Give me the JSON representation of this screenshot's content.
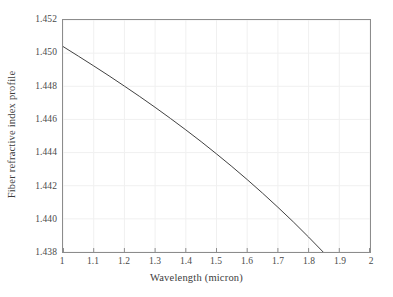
{
  "chart_data": {
    "type": "line",
    "title": "",
    "xlabel": "Wavelength (micron)",
    "ylabel": "Fiber refractive index profile",
    "xlim": [
      1,
      2
    ],
    "ylim": [
      1.438,
      1.452
    ],
    "grid": true,
    "legend": null,
    "xticks": [
      "1",
      "1.1",
      "1.2",
      "1.3",
      "1.4",
      "1.5",
      "1.6",
      "1.7",
      "1.8",
      "1.9",
      "2"
    ],
    "xtick_values": [
      1,
      1.1,
      1.2,
      1.3,
      1.4,
      1.5,
      1.6,
      1.7,
      1.8,
      1.9,
      2
    ],
    "yticks": [
      "1.452",
      "1.450",
      "1.448",
      "1.446",
      "1.444",
      "1.442",
      "1.440",
      "1.438"
    ],
    "ytick_values": [
      1.452,
      1.45,
      1.448,
      1.446,
      1.444,
      1.442,
      1.44,
      1.438
    ],
    "line_color": "#404040",
    "line_width": 1,
    "series": [
      {
        "name": "Fiber refractive index profile",
        "x": [
          1.0,
          1.05,
          1.1,
          1.15,
          1.2,
          1.25,
          1.3,
          1.35,
          1.4,
          1.45,
          1.5,
          1.55,
          1.6,
          1.65,
          1.7,
          1.75,
          1.8,
          1.85,
          1.9,
          1.95,
          2.0
        ],
        "y": [
          1.4504,
          1.44982,
          1.44923,
          1.44863,
          1.44801,
          1.44738,
          1.44673,
          1.44606,
          1.44537,
          1.44466,
          1.44392,
          1.44316,
          1.44237,
          1.44155,
          1.4407,
          1.43982,
          1.4389,
          1.43795,
          1.43696,
          1.43594,
          1.438
        ]
      }
    ]
  },
  "axes": {
    "frame_color": "#8c8c8c",
    "grid_color": "#f0f0f0"
  }
}
